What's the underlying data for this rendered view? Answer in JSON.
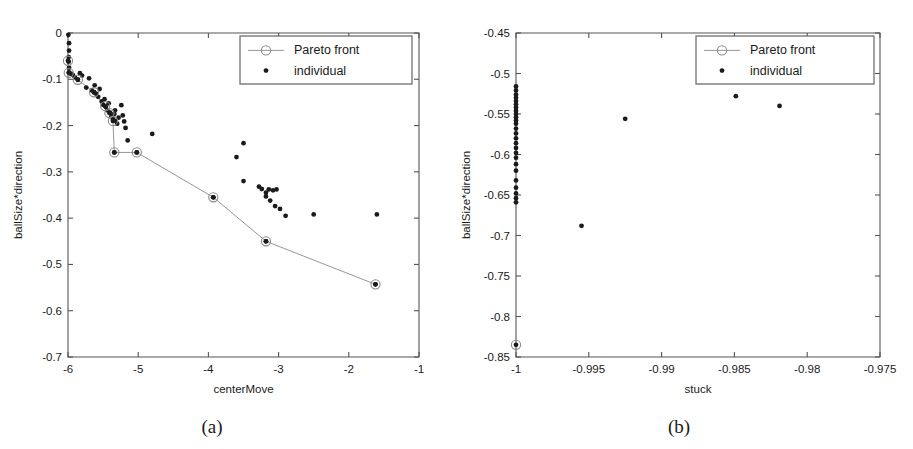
{
  "figure": {
    "panels": [
      {
        "key": "a",
        "caption": "(a)",
        "xlabel": "centerMove",
        "ylabel": "ballSize*direction"
      },
      {
        "key": "b",
        "caption": "(b)",
        "xlabel": "stuck",
        "ylabel": "ballSize*direction"
      }
    ],
    "legend": {
      "pareto_label": "Pareto front",
      "individual_label": "individual"
    }
  },
  "chart_data": [
    {
      "type": "scatter",
      "panel": "a",
      "title": "",
      "xlabel": "centerMove",
      "ylabel": "ballSize*direction",
      "xlim": [
        -6,
        -1
      ],
      "ylim": [
        -0.7,
        0
      ],
      "xticks": [
        -6,
        -5,
        -4,
        -3,
        -2,
        -1
      ],
      "xticklabels": [
        "-6",
        "-5",
        "-4",
        "-3",
        "-2",
        "-1"
      ],
      "yticks": [
        0,
        -0.1,
        -0.2,
        -0.3,
        -0.4,
        -0.5,
        -0.6,
        -0.7
      ],
      "yticklabels": [
        "0",
        "-0.1",
        "-0.2",
        "-0.3",
        "-0.4",
        "-0.5",
        "-0.6",
        "-0.7"
      ],
      "grid": false,
      "legend_position": "upper right",
      "series": [
        {
          "name": "individual",
          "marker": "filled-dot",
          "color": "#1b1b1b",
          "points": [
            [
              -5.995,
              -0.004
            ],
            [
              -5.985,
              -0.022
            ],
            [
              -5.985,
              -0.038
            ],
            [
              -5.99,
              -0.052
            ],
            [
              -5.99,
              -0.062
            ],
            [
              -5.985,
              -0.075
            ],
            [
              -5.985,
              -0.085
            ],
            [
              -5.96,
              -0.088
            ],
            [
              -5.93,
              -0.091
            ],
            [
              -5.9,
              -0.096
            ],
            [
              -5.86,
              -0.101
            ],
            [
              -5.83,
              -0.087
            ],
            [
              -5.8,
              -0.092
            ],
            [
              -5.74,
              -0.118
            ],
            [
              -5.7,
              -0.098
            ],
            [
              -5.66,
              -0.124
            ],
            [
              -5.63,
              -0.128
            ],
            [
              -5.6,
              -0.131
            ],
            [
              -5.62,
              -0.113
            ],
            [
              -5.57,
              -0.138
            ],
            [
              -5.55,
              -0.121
            ],
            [
              -5.52,
              -0.148
            ],
            [
              -5.5,
              -0.155
            ],
            [
              -5.48,
              -0.143
            ],
            [
              -5.46,
              -0.16
            ],
            [
              -5.44,
              -0.167
            ],
            [
              -5.42,
              -0.152
            ],
            [
              -5.4,
              -0.172
            ],
            [
              -5.38,
              -0.18
            ],
            [
              -5.36,
              -0.186
            ],
            [
              -5.34,
              -0.175
            ],
            [
              -5.32,
              -0.19
            ],
            [
              -5.3,
              -0.196
            ],
            [
              -5.33,
              -0.167
            ],
            [
              -5.28,
              -0.183
            ],
            [
              -5.24,
              -0.156
            ],
            [
              -5.22,
              -0.178
            ],
            [
              -5.2,
              -0.191
            ],
            [
              -5.18,
              -0.205
            ],
            [
              -5.34,
              -0.258
            ],
            [
              -5.15,
              -0.232
            ],
            [
              -5.02,
              -0.258
            ],
            [
              -4.8,
              -0.218
            ],
            [
              -3.6,
              -0.268
            ],
            [
              -3.5,
              -0.238
            ],
            [
              -3.5,
              -0.32
            ],
            [
              -3.28,
              -0.332
            ],
            [
              -3.24,
              -0.337
            ],
            [
              -3.18,
              -0.345
            ],
            [
              -3.14,
              -0.338
            ],
            [
              -3.08,
              -0.34
            ],
            [
              -3.03,
              -0.338
            ],
            [
              -3.18,
              -0.353
            ],
            [
              -3.12,
              -0.362
            ],
            [
              -3.05,
              -0.374
            ],
            [
              -2.98,
              -0.38
            ],
            [
              -2.9,
              -0.395
            ],
            [
              -2.5,
              -0.392
            ],
            [
              -1.6,
              -0.392
            ],
            [
              -3.93,
              -0.355
            ],
            [
              -3.18,
              -0.45
            ],
            [
              -1.62,
              -0.543
            ]
          ]
        },
        {
          "name": "Pareto front",
          "marker": "open-circle-on-dot",
          "color": "#8a8a8a",
          "connected": true,
          "points": [
            [
              -6.0,
              -0.06
            ],
            [
              -5.99,
              -0.086
            ],
            [
              -5.86,
              -0.101
            ],
            [
              -5.63,
              -0.128
            ],
            [
              -5.47,
              -0.158
            ],
            [
              -5.41,
              -0.173
            ],
            [
              -5.36,
              -0.19
            ],
            [
              -5.34,
              -0.258
            ],
            [
              -5.02,
              -0.258
            ],
            [
              -3.93,
              -0.355
            ],
            [
              -3.18,
              -0.45
            ],
            [
              -1.62,
              -0.543
            ]
          ]
        }
      ]
    },
    {
      "type": "scatter",
      "panel": "b",
      "title": "",
      "xlabel": "stuck",
      "ylabel": "ballSize*direction",
      "xlim": [
        -1,
        -0.975
      ],
      "ylim": [
        -0.85,
        -0.45
      ],
      "xticks": [
        -1,
        -0.995,
        -0.99,
        -0.985,
        -0.98,
        -0.975
      ],
      "xticklabels": [
        "-1",
        "-0.995",
        "-0.99",
        "-0.985",
        "-0.98",
        "-0.975"
      ],
      "yticks": [
        -0.45,
        -0.5,
        -0.55,
        -0.6,
        -0.65,
        -0.7,
        -0.75,
        -0.8,
        -0.85
      ],
      "yticklabels": [
        "-0.45",
        "-0.5",
        "-0.55",
        "-0.6",
        "-0.65",
        "-0.7",
        "-0.75",
        "-0.8",
        "-0.85"
      ],
      "grid": false,
      "legend_position": "upper right",
      "series": [
        {
          "name": "individual",
          "marker": "filled-dot",
          "color": "#1b1b1b",
          "points": [
            [
              -1.0,
              -0.516
            ],
            [
              -1.0,
              -0.521
            ],
            [
              -1.0,
              -0.526
            ],
            [
              -1.0,
              -0.53
            ],
            [
              -1.0,
              -0.534
            ],
            [
              -1.0,
              -0.538
            ],
            [
              -1.0,
              -0.542
            ],
            [
              -1.0,
              -0.546
            ],
            [
              -1.0,
              -0.55
            ],
            [
              -1.0,
              -0.554
            ],
            [
              -1.0,
              -0.558
            ],
            [
              -1.0,
              -0.562
            ],
            [
              -1.0,
              -0.568
            ],
            [
              -1.0,
              -0.574
            ],
            [
              -1.0,
              -0.58
            ],
            [
              -1.0,
              -0.586
            ],
            [
              -1.0,
              -0.592
            ],
            [
              -1.0,
              -0.598
            ],
            [
              -1.0,
              -0.604
            ],
            [
              -1.0,
              -0.612
            ],
            [
              -1.0,
              -0.62
            ],
            [
              -1.0,
              -0.632
            ],
            [
              -1.0,
              -0.641
            ],
            [
              -1.0,
              -0.648
            ],
            [
              -1.0,
              -0.654
            ],
            [
              -1.0,
              -0.659
            ],
            [
              -0.9955,
              -0.688
            ],
            [
              -0.9925,
              -0.556
            ],
            [
              -0.9849,
              -0.528
            ],
            [
              -0.9819,
              -0.54
            ]
          ]
        },
        {
          "name": "Pareto front",
          "marker": "open-circle-on-dot",
          "color": "#8a8a8a",
          "connected": true,
          "points": [
            [
              -1.0,
              -0.835
            ]
          ]
        }
      ]
    }
  ]
}
